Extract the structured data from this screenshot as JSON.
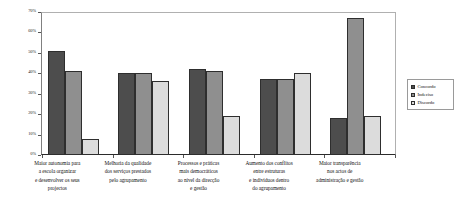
{
  "chart_data": {
    "type": "bar",
    "title": "",
    "xlabel": "",
    "ylabel": "",
    "ylim": [
      0,
      70
    ],
    "grid": false,
    "legend_position": "right",
    "ytick_labels": [
      "70%",
      "60%",
      "50%",
      "40%",
      "30%",
      "20%",
      "10%",
      "0%"
    ],
    "ytick_values": [
      70,
      60,
      50,
      40,
      30,
      20,
      10,
      0
    ],
    "categories": [
      "Maior autonomia para a escola organizar e desenvolver os seus projectos",
      "Melhoria da qualidade dos serviços prestados pelo agrupamento",
      "Processos e práticas mais democráticos ao nível da direcção e gestão",
      "Aumento dos conflitos entre estruturas e indivíduos dentro do agrupamento",
      "Maior transparência nos actos de administração e gestão"
    ],
    "category_lines": [
      [
        "Maior autonomia para",
        "a escola organizar",
        "e desenvolver os seus",
        "projectos"
      ],
      [
        "Melhoria da qualidade",
        "dos serviços prestados",
        "pelo agrupamento"
      ],
      [
        "Processos e práticas",
        "mais democráticos",
        "ao nível da direcção",
        "e gestão"
      ],
      [
        "Aumento dos conflitos",
        "entre estruturas",
        "e indivíduos dentro",
        "do agrupamento"
      ],
      [
        "Maior transparência",
        "nos actos de",
        "administração e gestão"
      ]
    ],
    "series": [
      {
        "name": "Concordo",
        "color": "#4d4d4d",
        "values": [
          51,
          40,
          42,
          37,
          18
        ]
      },
      {
        "name": "Indeciso",
        "color": "#8f8f8f",
        "values": [
          41,
          40,
          41,
          37,
          67
        ]
      },
      {
        "name": "Discordo",
        "color": "#dcdcdc",
        "values": [
          8,
          36,
          19,
          40,
          19
        ]
      }
    ]
  },
  "legend": {
    "items": [
      {
        "label": "Concordo",
        "color": "#4d4d4d"
      },
      {
        "label": "Indeciso",
        "color": "#8f8f8f"
      },
      {
        "label": "Discordo",
        "color": "#dcdcdc"
      }
    ]
  }
}
